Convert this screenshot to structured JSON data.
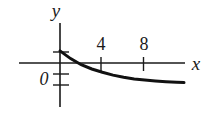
{
  "chart_data": {
    "type": "line",
    "title": "",
    "xlabel": "x",
    "ylabel": "y",
    "x_ticks": [
      4,
      8
    ],
    "x_tick_labels": [
      "4",
      "8"
    ],
    "y_ticks": [
      1,
      -1,
      -2
    ],
    "origin_label": "0",
    "xlim": [
      -4,
      12
    ],
    "ylim": [
      -4,
      4
    ],
    "grid": false,
    "legend": null,
    "series": [
      {
        "name": "curve",
        "description": "decaying curve approaching a negative horizontal asymptote",
        "x": [
          0,
          1,
          2,
          3,
          4,
          5,
          6,
          7,
          8,
          9,
          10,
          11,
          11.7
        ],
        "y": [
          1.1,
          0.4,
          -0.15,
          -0.55,
          -0.85,
          -1.1,
          -1.3,
          -1.45,
          -1.55,
          -1.63,
          -1.7,
          -1.75,
          -1.78
        ]
      }
    ]
  },
  "labels": {
    "x_axis": "x",
    "y_axis": "y",
    "origin": "0",
    "tick_4": "4",
    "tick_8": "8"
  },
  "colors": {
    "axis": "#1a1a1a",
    "curve": "#111111",
    "background": "#ffffff"
  }
}
